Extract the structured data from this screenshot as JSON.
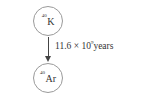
{
  "diagram": {
    "parent": {
      "mass_number": "40",
      "symbol": "K"
    },
    "daughter": {
      "mass_number": "40",
      "symbol": "Ar"
    },
    "transition": {
      "coefficient": "11.6",
      "times": "×",
      "base": "10",
      "exponent": "9",
      "unit": "years"
    }
  }
}
